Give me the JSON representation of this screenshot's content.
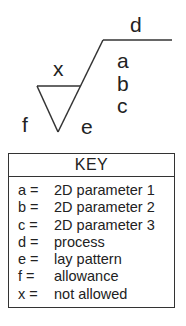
{
  "symbol": {
    "labels": {
      "d": "d",
      "a": "a",
      "b": "b",
      "c": "c",
      "x": "x",
      "f": "f",
      "e": "e"
    },
    "stroke_color": "#333333"
  },
  "key": {
    "title": "KEY",
    "rows": [
      {
        "key": "a =",
        "value": "2D parameter 1"
      },
      {
        "key": "b =",
        "value": "2D parameter 2"
      },
      {
        "key": "c =",
        "value": "2D parameter 3"
      },
      {
        "key": "d =",
        "value": "process"
      },
      {
        "key": "e =",
        "value": "lay pattern"
      },
      {
        "key": "f  =",
        "value": "allowance"
      },
      {
        "key": "x =",
        "value": "not allowed"
      }
    ]
  }
}
